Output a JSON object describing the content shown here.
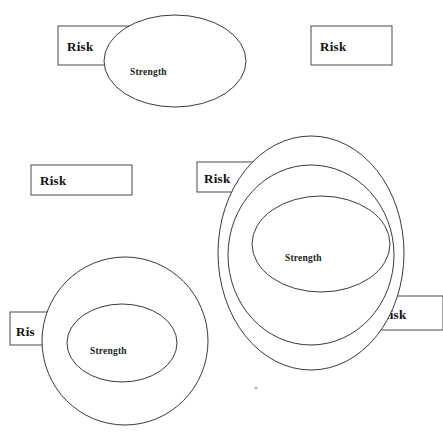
{
  "canvas": {
    "width": 443,
    "height": 433,
    "background": "#ffffff",
    "stroke_color": "#3a3a3a",
    "box_stroke_color": "#5a5a5a",
    "text_color": "#111111"
  },
  "labels": {
    "risk": "Risk",
    "risk_clipped_ris": "Ris",
    "risk_clipped_risk": "Risk",
    "strength": "Strength"
  },
  "groups": [
    {
      "id": "group-top",
      "name": "single-ellipse-with-overlapping-risk-box",
      "risk_box": {
        "x": 58,
        "y": 26,
        "w": 78,
        "h": 39,
        "label": "Risk",
        "label_x": 67,
        "label_y": 51
      },
      "ellipses": [
        {
          "cx": 175,
          "cy": 61,
          "rx": 71,
          "ry": 46
        }
      ],
      "strength_label": {
        "text": "Strength",
        "x": 130,
        "y": 75
      }
    },
    {
      "id": "group-top-right",
      "name": "standalone-risk-box",
      "risk_box": {
        "x": 311,
        "y": 26,
        "w": 81,
        "h": 39,
        "label": "Risk",
        "label_x": 320,
        "label_y": 51
      },
      "ellipses": [],
      "strength_label": null
    },
    {
      "id": "group-middle-left",
      "name": "standalone-risk-box-2",
      "risk_box": {
        "x": 31,
        "y": 165,
        "w": 101,
        "h": 30,
        "label": "Risk",
        "label_x": 40,
        "label_y": 185
      },
      "ellipses": [],
      "strength_label": null
    },
    {
      "id": "group-right",
      "name": "triple-nested-ellipses-with-two-risk-boxes",
      "risk_box": {
        "x": 197,
        "y": 162,
        "w": 58,
        "h": 30,
        "label": "Risk",
        "label_x": 204,
        "label_y": 183
      },
      "risk_box_2": {
        "x": 376,
        "y": 296,
        "w": 67,
        "h": 34,
        "label": "Risk",
        "label_x": 380,
        "label_y": 319
      },
      "ellipses": [
        {
          "cx": 311,
          "cy": 253,
          "rx": 93,
          "ry": 117
        },
        {
          "cx": 311,
          "cy": 255,
          "rx": 83,
          "ry": 90
        },
        {
          "cx": 321,
          "cy": 244,
          "rx": 69,
          "ry": 48
        }
      ],
      "strength_label": {
        "text": "Strength",
        "x": 285,
        "y": 261
      }
    },
    {
      "id": "group-bottom-left",
      "name": "double-concentric-circles-with-risk-box",
      "risk_box": {
        "x": 10,
        "y": 312,
        "w": 45,
        "h": 33,
        "label": "Ris",
        "label_x": 16,
        "label_y": 336
      },
      "ellipses": [
        {
          "cx": 125,
          "cy": 341,
          "rx": 83,
          "ry": 84
        },
        {
          "cx": 122,
          "cy": 343,
          "rx": 55,
          "ry": 39
        }
      ],
      "strength_label": {
        "text": "Strength",
        "x": 90,
        "y": 354
      }
    }
  ],
  "speck": {
    "x": 256,
    "y": 388,
    "r": 1.6
  }
}
